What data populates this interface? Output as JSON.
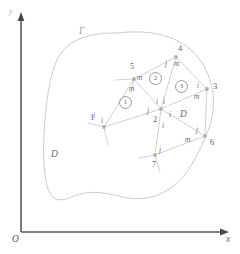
{
  "figure": {
    "type": "finite-element-mesh-diagram",
    "axes": {
      "origin_label": "O",
      "x_label": "x",
      "y_label": "y"
    },
    "domain_label": "D",
    "domain_label_inner": "D",
    "boundary_label": "Γ",
    "nodes": [
      {
        "id": "1",
        "label": "1",
        "x": 97,
        "y": 119
      },
      {
        "id": "2",
        "label": "2",
        "x": 159,
        "y": 116
      },
      {
        "id": "3",
        "label": "3",
        "x": 209,
        "y": 86
      },
      {
        "id": "4",
        "label": "4",
        "x": 176,
        "y": 50
      },
      {
        "id": "5",
        "label": "5",
        "x": 131,
        "y": 68
      },
      {
        "id": "6",
        "label": "6",
        "x": 203,
        "y": 143
      },
      {
        "id": "7",
        "label": "7",
        "x": 157,
        "y": 161
      }
    ],
    "elements": [
      {
        "id": "1",
        "label": "1",
        "x": 125,
        "y": 100
      },
      {
        "id": "2",
        "label": "2",
        "x": 154,
        "y": 78
      },
      {
        "id": "3",
        "label": "3",
        "x": 180,
        "y": 84
      }
    ],
    "local_node_labels": [
      {
        "text": "m",
        "x": 137,
        "y": 75
      },
      {
        "text": "m",
        "x": 130,
        "y": 86
      },
      {
        "text": "i",
        "x": 93,
        "y": 113
      },
      {
        "text": "i",
        "x": 101,
        "y": 118
      },
      {
        "text": "j",
        "x": 148,
        "y": 111
      },
      {
        "text": "i",
        "x": 157,
        "y": 101
      },
      {
        "text": "i",
        "x": 164,
        "y": 101
      },
      {
        "text": "i",
        "x": 170,
        "y": 115
      },
      {
        "text": "i",
        "x": 163,
        "y": 126
      },
      {
        "text": "j",
        "x": 166,
        "y": 61
      },
      {
        "text": "m",
        "x": 175,
        "y": 61
      },
      {
        "text": "i",
        "x": 196,
        "y": 83
      },
      {
        "text": "m",
        "x": 195,
        "y": 95
      },
      {
        "text": "j",
        "x": 194,
        "y": 131
      },
      {
        "text": "m",
        "x": 187,
        "y": 140
      },
      {
        "text": "j",
        "x": 160,
        "y": 150
      }
    ]
  },
  "colors": {
    "axis": "#555555",
    "boundary": "#b8b8b8",
    "mesh": "#c2c2c2",
    "node": "#a8a8a8",
    "text": "#6a6a6a"
  }
}
